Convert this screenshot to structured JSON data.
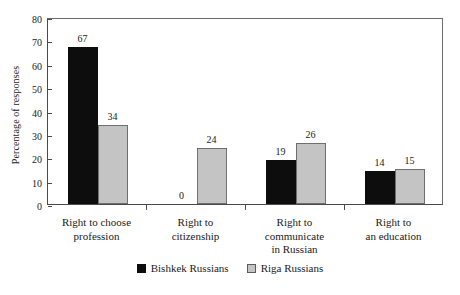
{
  "chart_data": {
    "type": "bar",
    "title": "",
    "xlabel": "",
    "ylabel": "Percentage of responses",
    "ylim": [
      0,
      80
    ],
    "ytick_step": 10,
    "yticks": [
      "0",
      "10",
      "20",
      "30",
      "40",
      "50",
      "60",
      "70",
      "80"
    ],
    "grid": false,
    "legend_position": "bottom-center",
    "categories": [
      "Right to choose profession",
      "Right to citizenship",
      "Right to communicate in Russian",
      "Right to an education"
    ],
    "category_label_lines": [
      [
        "Right to choose",
        "profession"
      ],
      [
        "Right to",
        "citizenship"
      ],
      [
        "Right to",
        "communicate",
        "in Russian"
      ],
      [
        "Right to",
        "an education"
      ]
    ],
    "series": [
      {
        "name": "Bishkek Russians",
        "color": "#0d0d0d",
        "values": [
          67,
          0,
          19,
          14
        ],
        "labels": [
          "67",
          "0",
          "19",
          "14"
        ]
      },
      {
        "name": "Riga Russians",
        "color": "#c4c4c4",
        "values": [
          34,
          24,
          26,
          15
        ],
        "labels": [
          "34",
          "24",
          "26",
          "15"
        ]
      }
    ]
  },
  "legend": {
    "items": [
      {
        "label": "Bishkek Russians",
        "swatch": "black"
      },
      {
        "label": "Riga Russians",
        "swatch": "gray"
      }
    ]
  }
}
